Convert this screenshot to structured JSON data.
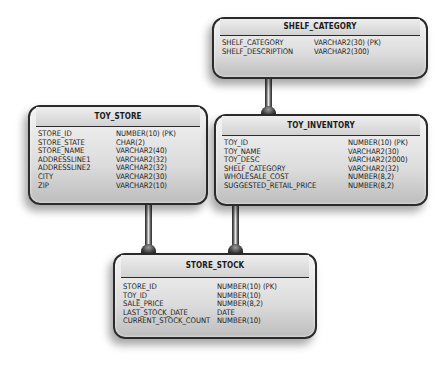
{
  "entities": {
    "shelf_category": {
      "title": "SHELF_CATEGORY",
      "fields": [
        {
          "name": "SHELF_CATEGORY",
          "type": "VARCHAR2(30) (PK)"
        },
        {
          "name": "SHELF_DESCRIPTION",
          "type": "VARCHAR2(300)"
        }
      ]
    },
    "toy_store": {
      "title": "TOY_STORE",
      "fields": [
        {
          "name": "STORE_ID",
          "type": "NUMBER(10) (PK)"
        },
        {
          "name": "STORE_STATE",
          "type": "CHAR(2)"
        },
        {
          "name": "STORE_NAME",
          "type": "VARCHAR2(40)"
        },
        {
          "name": "ADDRESSLINE1",
          "type": "VARCHAR2(32)"
        },
        {
          "name": "ADDRESSLINE2",
          "type": "VARCHAR2(32)"
        },
        {
          "name": "CITY",
          "type": "VARCHAR2(30)"
        },
        {
          "name": "ZIP",
          "type": "VARCHAR2(10)"
        }
      ]
    },
    "toy_inventory": {
      "title": "TOY_INVENTORY",
      "fields": [
        {
          "name": "TOY_ID",
          "type": "NUMBER(10) (PK)"
        },
        {
          "name": "TOY_NAME",
          "type": "VARCHAR2(30)"
        },
        {
          "name": "TOY_DESC",
          "type": "VARCHAR2(2000)"
        },
        {
          "name": "SHELF_CATEGORY",
          "type": "VARCHAR2(32)"
        },
        {
          "name": "WHOLESALE_COST",
          "type": "NUMBER(8,2)"
        },
        {
          "name": "SUGGESTED_RETAIL_PRICE",
          "type": "NUMBER(8,2)"
        }
      ]
    },
    "store_stock": {
      "title": "STORE_STOCK",
      "fields": [
        {
          "name": "STORE_ID",
          "type": "NUMBER(10) (PK)"
        },
        {
          "name": "TOY_ID",
          "type": "NUMBER(10)"
        },
        {
          "name": "SALE_PRICE",
          "type": "NUMBER(8,2)"
        },
        {
          "name": "LAST_STOCK_DATE",
          "type": "DATE"
        },
        {
          "name": "CURRENT_STOCK_COUNT",
          "type": "NUMBER(10)"
        }
      ]
    }
  },
  "relationships": [
    {
      "from": "SHELF_CATEGORY",
      "to": "TOY_INVENTORY"
    },
    {
      "from": "TOY_STORE",
      "to": "STORE_STOCK"
    },
    {
      "from": "TOY_INVENTORY",
      "to": "STORE_STOCK"
    }
  ]
}
